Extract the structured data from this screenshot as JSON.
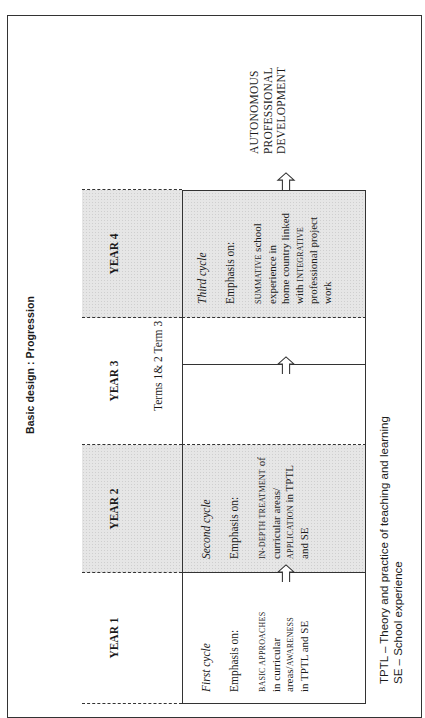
{
  "figure": {
    "title": "Basic design : Progression"
  },
  "years": [
    {
      "label": "YEAR 1",
      "shaded": false
    },
    {
      "label": "YEAR 2",
      "shaded": true
    },
    {
      "label": "YEAR 3",
      "shaded": false
    },
    {
      "label": "YEAR 4",
      "shaded": true
    }
  ],
  "terms_label": "Terms 1& 2 Term 3",
  "cycles": [
    {
      "name": "First cycle",
      "emphasis": "Emphasis on:",
      "desc_lines": [
        {
          "caps": "BASIC APPROACHES",
          "rest": ""
        },
        {
          "caps": "",
          "rest": "in curricular"
        },
        {
          "caps": "",
          "rest": "areas/",
          "caps2": "AWARENESS"
        },
        {
          "caps": "",
          "rest": "in TPTL and SE"
        }
      ]
    },
    {
      "name": "Second cycle",
      "emphasis": "Emphasis on:",
      "desc_lines": [
        {
          "caps": "IN-DEPTH TREATMENT",
          "rest": " of"
        },
        {
          "caps": "",
          "rest": "curricular areas/"
        },
        {
          "caps": "APPLICATION",
          "rest": " in TPTL"
        },
        {
          "caps": "",
          "rest": "and SE"
        }
      ]
    },
    {
      "name": "Third cycle",
      "emphasis": "Emphasis on:",
      "desc_lines": [
        {
          "caps": "SUMMATIVE",
          "rest": " school"
        },
        {
          "caps": "",
          "rest": "experience in"
        },
        {
          "caps": "",
          "rest": "home country linked"
        },
        {
          "caps": "",
          "rest": "with ",
          "caps2": "INTEGRATIVE"
        },
        {
          "caps": "",
          "rest": "professional project"
        },
        {
          "caps": "",
          "rest": "work"
        }
      ]
    }
  ],
  "outcome": {
    "lines": [
      "AUTONOMOUS",
      "PROFESSIONAL",
      "DEVELOPMENT"
    ]
  },
  "legend": {
    "lines": [
      "TPTL – Theory and practice of teaching and learning",
      "SE – School experience"
    ]
  },
  "icons": {
    "progression_arrow": "up-arrow-outline"
  },
  "colors": {
    "shading": "#e6e6e6",
    "lines": "#333333"
  }
}
